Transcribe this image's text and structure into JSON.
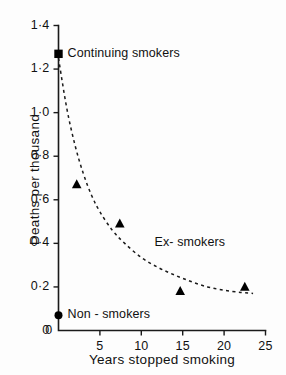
{
  "chart_data": {
    "type": "scatter",
    "title": "",
    "xlabel": "Years stopped smoking",
    "ylabel": "Deaths per thousand",
    "xlim": [
      0,
      25
    ],
    "ylim": [
      0,
      1.4
    ],
    "grid": false,
    "legend_position": "inline-annotations",
    "x_ticks": [
      {
        "value": 0,
        "label": "0"
      },
      {
        "value": 5,
        "label": "5"
      },
      {
        "value": 10,
        "label": "10"
      },
      {
        "value": 15,
        "label": "15"
      },
      {
        "value": 20,
        "label": "20"
      },
      {
        "value": 25,
        "label": "25"
      }
    ],
    "y_ticks": [
      {
        "value": 0,
        "label": "0"
      },
      {
        "value": 0.2,
        "label": "0·2"
      },
      {
        "value": 0.4,
        "label": "0·4"
      },
      {
        "value": 0.6,
        "label": "0·6"
      },
      {
        "value": 0.8,
        "label": "0·8"
      },
      {
        "value": 1.0,
        "label": "1·0"
      },
      {
        "value": 1.2,
        "label": "1·2"
      },
      {
        "value": 1.4,
        "label": "1·4"
      }
    ],
    "series": [
      {
        "name": "Continuing smokers",
        "marker": "square",
        "points": [
          {
            "x": 0,
            "y": 1.27
          }
        ]
      },
      {
        "name": "Ex- smokers",
        "marker": "triangle",
        "points": [
          {
            "x": 2.2,
            "y": 0.67
          },
          {
            "x": 7.4,
            "y": 0.49
          },
          {
            "x": 14.7,
            "y": 0.18
          },
          {
            "x": 22.5,
            "y": 0.2
          }
        ]
      },
      {
        "name": "Non - smokers",
        "marker": "circle",
        "points": [
          {
            "x": 0,
            "y": 0.07
          }
        ]
      }
    ],
    "fit_curve": {
      "name": "Ex-smokers fitted decline",
      "style": "dashed",
      "points": [
        {
          "x": 0.0,
          "y": 1.25
        },
        {
          "x": 1.0,
          "y": 1.02
        },
        {
          "x": 2.0,
          "y": 0.85
        },
        {
          "x": 3.0,
          "y": 0.72
        },
        {
          "x": 4.0,
          "y": 0.62
        },
        {
          "x": 5.0,
          "y": 0.545
        },
        {
          "x": 6.5,
          "y": 0.46
        },
        {
          "x": 8.0,
          "y": 0.4
        },
        {
          "x": 10.0,
          "y": 0.335
        },
        {
          "x": 12.0,
          "y": 0.29
        },
        {
          "x": 14.0,
          "y": 0.255
        },
        {
          "x": 16.0,
          "y": 0.225
        },
        {
          "x": 18.0,
          "y": 0.2
        },
        {
          "x": 20.0,
          "y": 0.185
        },
        {
          "x": 22.0,
          "y": 0.175
        },
        {
          "x": 23.5,
          "y": 0.17
        }
      ]
    },
    "annotations": [
      {
        "text": "Continuing smokers",
        "x": 1.1,
        "y": 1.27
      },
      {
        "text": "Ex- smokers",
        "x": 11.6,
        "y": 0.4
      },
      {
        "text": "Non - smokers",
        "x": 1.1,
        "y": 0.07
      }
    ]
  }
}
